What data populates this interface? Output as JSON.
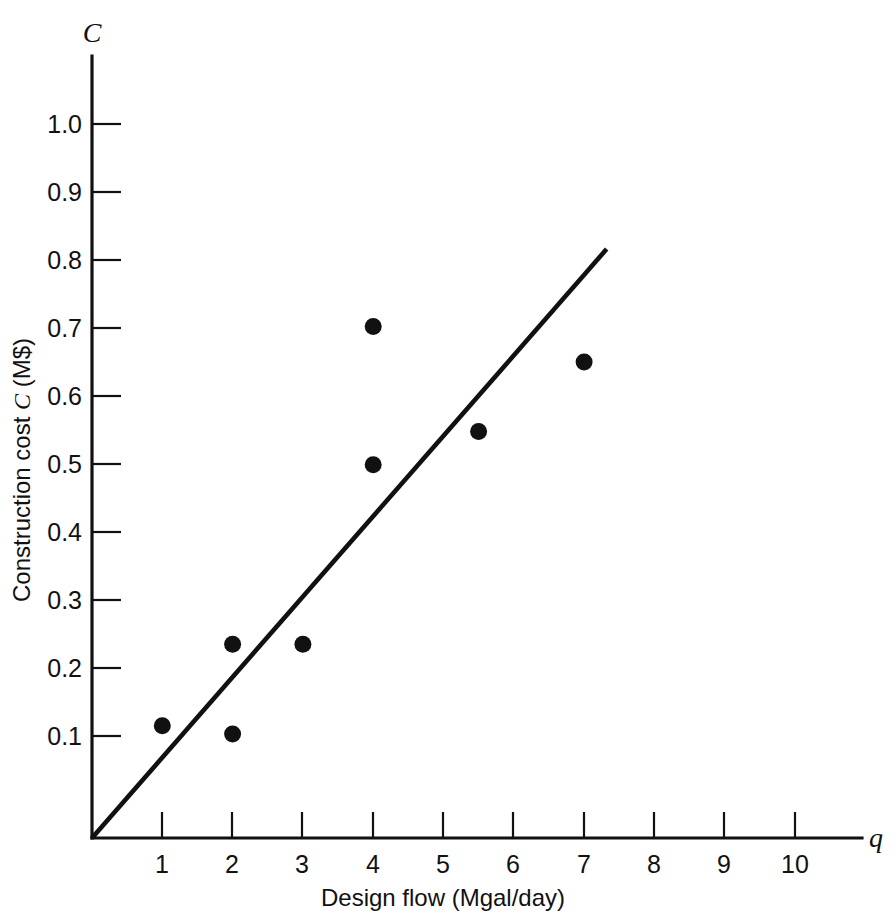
{
  "chart_data": {
    "type": "scatter",
    "title": "",
    "subtitle": "",
    "xlabel": "Design flow (Mgal/day)",
    "ylabel": "Construction cost C (M$)",
    "ylabel_parts": {
      "prefix": "Construction cost ",
      "italic": "C",
      "suffix": " (M$)"
    },
    "x_axis_symbol": "q",
    "y_axis_symbol": "C",
    "xlim": [
      0,
      11
    ],
    "ylim": [
      0,
      1.1
    ],
    "xticks": [
      1,
      2,
      3,
      4,
      5,
      6,
      7,
      8,
      9,
      10
    ],
    "xtick_labels": [
      "1",
      "2",
      "3",
      "4",
      "5",
      "6",
      "7",
      "8",
      "9",
      "10"
    ],
    "yticks": [
      0.1,
      0.2,
      0.3,
      0.4,
      0.5,
      0.6,
      0.7,
      0.8,
      0.9,
      1.0
    ],
    "ytick_labels": [
      "0.1",
      "0.2",
      "0.3",
      "0.4",
      "0.5",
      "0.6",
      "0.7",
      "0.8",
      "0.9",
      "1.0"
    ],
    "grid": false,
    "legend": null,
    "legend_position": "none",
    "marker_color": "#111111",
    "line_color": "#111111",
    "background_color": "#ffffff",
    "series": [
      {
        "name": "Observed plants",
        "type": "scatter",
        "points": [
          {
            "x": 1.0,
            "y": 0.165
          },
          {
            "x": 2.0,
            "y": 0.285
          },
          {
            "x": 2.0,
            "y": 0.153
          },
          {
            "x": 3.0,
            "y": 0.285
          },
          {
            "x": 4.0,
            "y": 0.752
          },
          {
            "x": 4.0,
            "y": 0.549
          },
          {
            "x": 5.5,
            "y": 0.598
          },
          {
            "x": 7.0,
            "y": 0.7
          }
        ]
      },
      {
        "name": "Fitted line",
        "type": "line",
        "points": [
          {
            "x": 0.0,
            "y": 0.0
          },
          {
            "x": 7.32,
            "y": 0.866
          }
        ]
      }
    ]
  },
  "figure": {
    "caption": "",
    "x_symbol": "q",
    "y_symbol": "C"
  }
}
